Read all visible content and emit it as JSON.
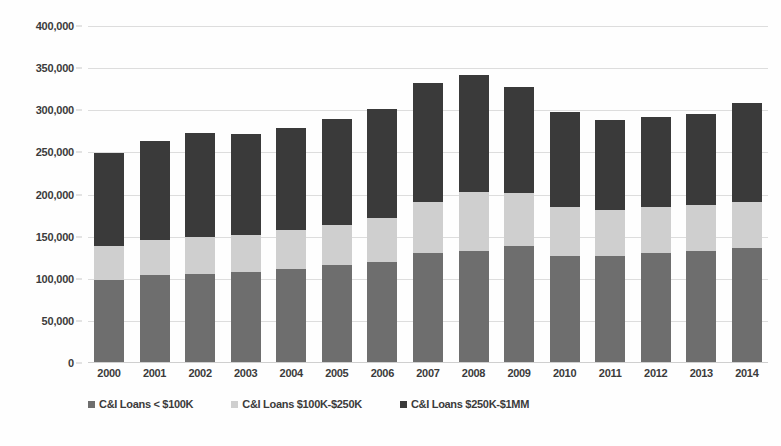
{
  "chart_data": {
    "type": "bar",
    "stacked": true,
    "title": "",
    "subtitle": "",
    "xlabel": "",
    "ylabel": "",
    "ylim": [
      0,
      400000
    ],
    "ytick_step": 50000,
    "ytick_labels": [
      "400,000",
      "350,000",
      "300,000",
      "250,000",
      "200,000",
      "150,000",
      "100,000",
      "50,000",
      "0"
    ],
    "ytick_values": [
      400000,
      350000,
      300000,
      250000,
      200000,
      150000,
      100000,
      50000,
      0
    ],
    "grid": true,
    "legend_position": "bottom",
    "categories": [
      "2000",
      "2001",
      "2002",
      "2003",
      "2004",
      "2005",
      "2006",
      "2007",
      "2008",
      "2009",
      "2010",
      "2011",
      "2012",
      "2013",
      "2014"
    ],
    "series": [
      {
        "name": "C&I Loans < $100K",
        "color": "#6e6e6e",
        "values": [
          99000,
          104000,
          106000,
          108000,
          112000,
          116000,
          120000,
          131000,
          133000,
          139000,
          127000,
          127000,
          130000,
          133000,
          136000
        ]
      },
      {
        "name": "C&I Loans $100K-$250K",
        "color": "#cfcfcf",
        "values": [
          40000,
          42000,
          44000,
          44000,
          46000,
          48000,
          52000,
          60000,
          70000,
          63000,
          58000,
          55000,
          55000,
          55000,
          55000
        ]
      },
      {
        "name": "C&I Loans $250K-$1MM",
        "color": "#3a3a3a",
        "values": [
          110000,
          117000,
          123000,
          120000,
          121000,
          126000,
          129000,
          141000,
          139000,
          126000,
          113000,
          107000,
          107000,
          107000,
          118000
        ]
      }
    ],
    "totals": [
      249000,
      263000,
      273000,
      272000,
      279000,
      290000,
      301000,
      332000,
      342000,
      328000,
      298000,
      289000,
      292000,
      295000,
      309000
    ]
  },
  "legend": {
    "items": [
      {
        "label": "C&I Loans < $100K",
        "marker": "square-swatch-small"
      },
      {
        "label": "C&I Loans $100K-$250K",
        "marker": "square-swatch-mid"
      },
      {
        "label": "C&I Loans $250K-$1MM",
        "marker": "square-swatch-large"
      }
    ]
  }
}
